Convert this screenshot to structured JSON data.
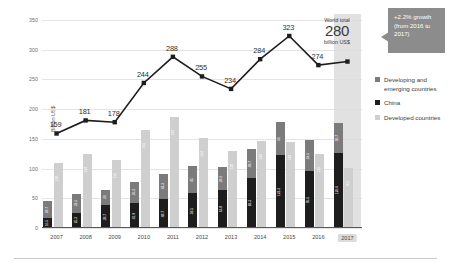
{
  "axes": {
    "ylabel": "Billion US$",
    "yticks": [
      0,
      50,
      100,
      150,
      200,
      250,
      300,
      350
    ],
    "ylim": [
      0,
      360
    ]
  },
  "callouts": {
    "world_total_top": "World total",
    "world_total_value": "280",
    "world_total_unit": "billion US$",
    "growth_text": "+2.2% growth (from 2016 to 2017)"
  },
  "legend": {
    "items": [
      {
        "label": "Developing and emerging countries",
        "color": "#7b7b7b"
      },
      {
        "label": "China",
        "color": "#1d1d1d"
      },
      {
        "label": "Developed countries",
        "color": "#cfcfcf"
      }
    ]
  },
  "chart_data": {
    "type": "bar",
    "title": "",
    "xlabel": "",
    "ylabel": "Billion US$",
    "ylim": [
      0,
      360
    ],
    "grid": true,
    "legend_position": "right",
    "highlight_category": "2017",
    "categories": [
      "2007",
      "2008",
      "2009",
      "2010",
      "2011",
      "2012",
      "2013",
      "2014",
      "2015",
      "2016",
      "2017"
    ],
    "series": [
      {
        "name": "China",
        "color": "#1d1d1d",
        "stack": "developing",
        "values": [
          16.5,
          25.3,
          38.7,
          41.9,
          48.7,
          58.5,
          63.8,
          83.3,
          122.3,
          95.5,
          126.6
        ]
      },
      {
        "name": "Developing and emerging countries",
        "color": "#7b7b7b",
        "stack": "developing",
        "values": [
          28.7,
          32.5,
          26.0,
          36.3,
          42.3,
          45.0,
          38.2,
          49.7,
          56.0,
          52.5,
          50.7
        ]
      },
      {
        "name": "Developed countries",
        "color": "#cfcfcf",
        "stack": "developed",
        "values": [
          110,
          124,
          115,
          165,
          187,
          152,
          130,
          146,
          144,
          125,
          101
        ]
      }
    ],
    "line_series": {
      "name": "World total",
      "color": "#1d1d1d",
      "values": [
        159,
        181,
        178,
        244,
        288,
        255,
        234,
        284,
        323,
        274,
        280
      ]
    }
  }
}
